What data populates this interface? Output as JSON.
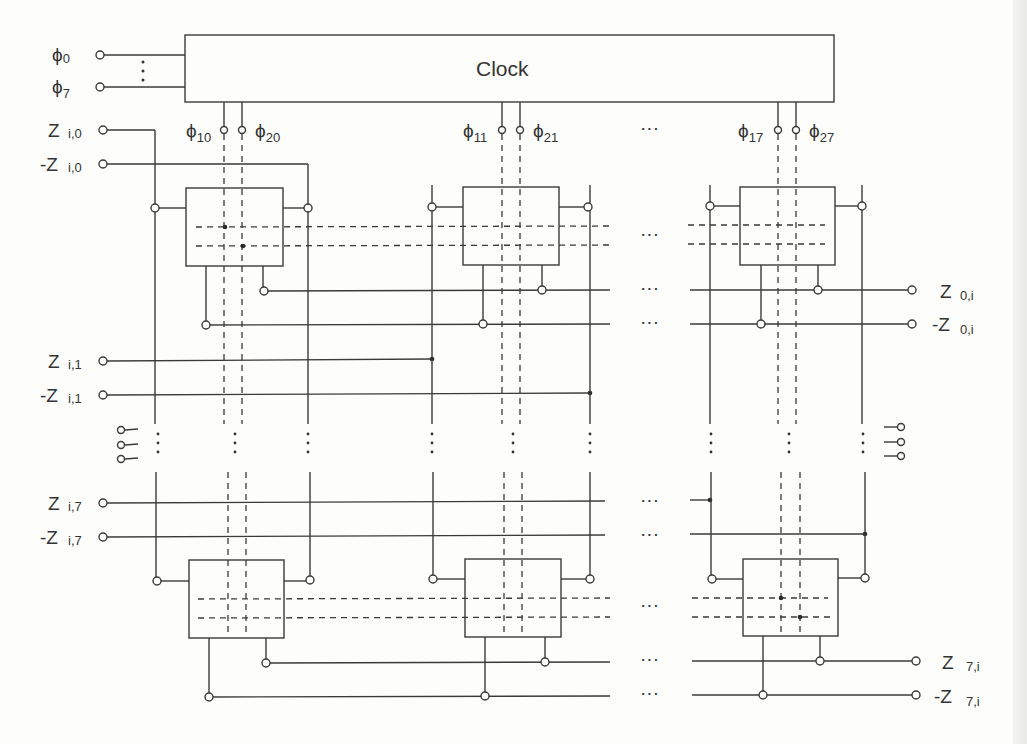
{
  "clock": {
    "label": "Clock"
  },
  "phase_inputs": [
    {
      "symbol": "ϕ",
      "sub": "0"
    },
    {
      "symbol": "ϕ",
      "sub": "7"
    }
  ],
  "clock_outputs": [
    {
      "left": {
        "symbol": "ϕ",
        "sub": "10"
      },
      "right": {
        "symbol": "ϕ",
        "sub": "20"
      }
    },
    {
      "left": {
        "symbol": "ϕ",
        "sub": "11"
      },
      "right": {
        "symbol": "ϕ",
        "sub": "21"
      }
    },
    {
      "left": {
        "symbol": "ϕ",
        "sub": "17"
      },
      "right": {
        "symbol": "ϕ",
        "sub": "27"
      }
    }
  ],
  "row_inputs": [
    {
      "name": "Z",
      "sub": "i,0"
    },
    {
      "name": "-Z",
      "sub": "i,0"
    },
    {
      "name": "Z",
      "sub": "i,1"
    },
    {
      "name": "-Z",
      "sub": "i,1"
    },
    {
      "name": "Z",
      "sub": "i,7"
    },
    {
      "name": "-Z",
      "sub": "i,7"
    }
  ],
  "column_outputs": [
    {
      "name": "Z",
      "sub": "0,i"
    },
    {
      "name": "-Z",
      "sub": "0,i"
    },
    {
      "name": "Z",
      "sub": "7,i"
    },
    {
      "name": "-Z",
      "sub": "7,i"
    }
  ],
  "ellipsis": {
    "horizontal": "···",
    "vertical": "⋮"
  },
  "colors": {
    "ink": "#3a3a3a",
    "paper": "#fdfdfb"
  }
}
